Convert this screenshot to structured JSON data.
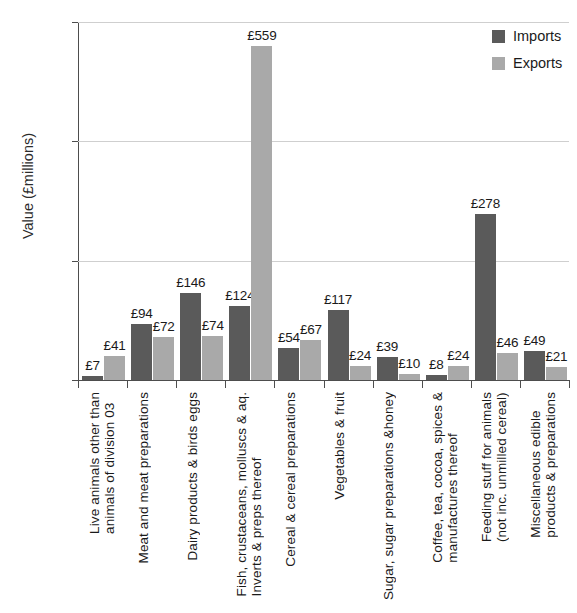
{
  "chart_data": {
    "type": "bar",
    "title": "",
    "xlabel": "",
    "ylabel": "Value (£millions)",
    "ylim": [
      0,
      600
    ],
    "yticks": [
      0,
      200,
      400,
      600
    ],
    "ytick_labels": [
      "0",
      "200",
      "400",
      "600"
    ],
    "grid": true,
    "legend_position": "top-right",
    "value_prefix": "£",
    "categories": [
      "Live animals other than animals of division 03",
      "Meat and meat preparations",
      "Dairy products & birds eggs",
      "Fish, crustaceans, molluscs & aq. Inverts & preps thereof",
      "Cereal & cereal preparations",
      "Vegetables & fruit",
      "Sugar, sugar preparations &honey",
      "Coffee, tea, cocoa, spices & manufactures thereof",
      "Feeding stuff for animals (not inc. unmilled cereal)",
      "Miscellaneous edible products & preparations"
    ],
    "category_lines": [
      [
        "Live animals other than",
        "animals of division 03"
      ],
      [
        "Meat and meat preparations",
        ""
      ],
      [
        "Dairy products & birds eggs",
        ""
      ],
      [
        "Fish, crustaceans, molluscs & aq.",
        "Inverts & preps thereof"
      ],
      [
        "Cereal & cereal preparations",
        ""
      ],
      [
        "Vegetables & fruit",
        ""
      ],
      [
        "Sugar, sugar preparations &honey",
        ""
      ],
      [
        "Coffee, tea, cocoa, spices &",
        "manufactures thereof"
      ],
      [
        "Feeding stuff for animals",
        "(not inc. unmilled cereal)"
      ],
      [
        "Miscellaneous edible",
        "products & preparations"
      ]
    ],
    "series": [
      {
        "name": "Imports",
        "color": "#5a5a5a",
        "values": [
          7,
          94,
          146,
          124,
          54,
          117,
          39,
          8,
          278,
          49
        ],
        "labels": [
          "£7",
          "£94",
          "£146",
          "£124",
          "£54",
          "£117",
          "£39",
          "£8",
          "£278",
          "£49"
        ]
      },
      {
        "name": "Exports",
        "color": "#a9a9a9",
        "values": [
          41,
          72,
          74,
          559,
          67,
          24,
          10,
          24,
          46,
          21
        ],
        "labels": [
          "£41",
          "£72",
          "£74",
          "£559",
          "£67",
          "£24",
          "£10",
          "£24",
          "£46",
          "£21"
        ]
      }
    ]
  },
  "legend": {
    "items": [
      {
        "label": "Imports",
        "color": "#5a5a5a"
      },
      {
        "label": "Exports",
        "color": "#a9a9a9"
      }
    ]
  }
}
